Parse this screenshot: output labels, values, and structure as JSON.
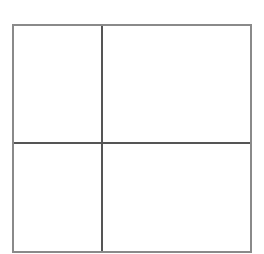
{
  "diagram": {
    "type": "2x2 grid",
    "rows": 2,
    "columns": 2,
    "outer_border_color": "#8a8a8a",
    "divider_color": "#555555",
    "background": "#ffffff",
    "cells": [
      {
        "row": 0,
        "col": 0,
        "label": ""
      },
      {
        "row": 0,
        "col": 1,
        "label": ""
      },
      {
        "row": 1,
        "col": 0,
        "label": ""
      },
      {
        "row": 1,
        "col": 1,
        "label": ""
      }
    ]
  }
}
